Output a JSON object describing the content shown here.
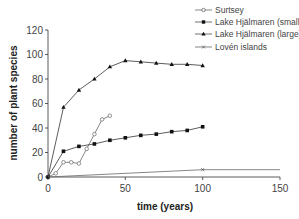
{
  "chart_data": {
    "type": "line",
    "title": "",
    "xlabel": "time (years)",
    "ylabel": "number of plant species",
    "xlim": [
      0,
      150
    ],
    "ylim": [
      0,
      120
    ],
    "xticks": [
      0,
      50,
      100,
      150
    ],
    "yticks": [
      0,
      20,
      40,
      60,
      80,
      100,
      120
    ],
    "grid": false,
    "legend_position": "top-right",
    "series": [
      {
        "name": "Surtsey",
        "marker": "open-circle",
        "x": [
          0,
          5,
          10,
          15,
          20,
          25,
          30,
          35,
          40
        ],
        "y": [
          0,
          3,
          12,
          12,
          11,
          23,
          35,
          47,
          50
        ]
      },
      {
        "name": "Lake Hjälmaren (small)",
        "marker": "filled-square",
        "x": [
          0,
          10,
          20,
          30,
          40,
          50,
          60,
          70,
          80,
          90,
          100
        ],
        "y": [
          0,
          21,
          25,
          27,
          30,
          32,
          34,
          35,
          37,
          38,
          41
        ]
      },
      {
        "name": "Lake Hjälmaren (large)",
        "marker": "filled-triangle",
        "x": [
          0,
          10,
          20,
          30,
          40,
          50,
          60,
          70,
          80,
          90,
          100
        ],
        "y": [
          0,
          57,
          71,
          80,
          90,
          95,
          94,
          93,
          92,
          92,
          91
        ]
      },
      {
        "name": "Lovén islands",
        "marker": "cross",
        "x": [
          0,
          100,
          150
        ],
        "y": [
          0,
          6,
          6
        ]
      }
    ]
  },
  "labels": {
    "xlabel": "time (years)",
    "ylabel": "number of plant species",
    "xticks": [
      "0",
      "50",
      "100",
      "150"
    ],
    "yticks": [
      "0",
      "20",
      "40",
      "60",
      "80",
      "100",
      "120"
    ],
    "legend": [
      "Surtsey",
      "Lake Hjälmaren (small)",
      "Lake Hjälmaren (large)",
      "Lovén islands"
    ]
  }
}
